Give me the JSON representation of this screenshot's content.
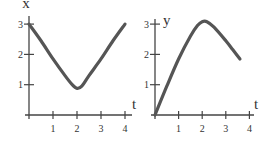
{
  "chart_data": [
    {
      "type": "line",
      "title": "",
      "xlabel": "t",
      "ylabel": "x",
      "xlim": [
        0,
        4
      ],
      "ylim": [
        0,
        3
      ],
      "xticks": [
        1,
        2,
        3,
        4
      ],
      "xtick_labels": [
        "1",
        "2",
        "3",
        "4"
      ],
      "yticks": [
        1,
        2,
        3
      ],
      "ytick_labels": [
        "1",
        "2",
        "3"
      ],
      "grid": false,
      "series": [
        {
          "name": "x(t)",
          "color": "#555555",
          "x": [
            0,
            0.5,
            1.0,
            1.5,
            1.8,
            2.0,
            2.2,
            2.5,
            3.0,
            3.5,
            4.0
          ],
          "y": [
            3.0,
            2.45,
            1.85,
            1.3,
            1.0,
            0.88,
            0.95,
            1.3,
            1.85,
            2.45,
            3.0
          ]
        }
      ]
    },
    {
      "type": "line",
      "title": "",
      "xlabel": "t",
      "ylabel": "y",
      "xlim": [
        0,
        4
      ],
      "ylim": [
        0,
        3
      ],
      "xticks": [
        1,
        2,
        3,
        4
      ],
      "xtick_labels": [
        "1",
        "2",
        "3",
        "4"
      ],
      "yticks": [
        1,
        2,
        3
      ],
      "ytick_labels": [
        "1",
        "2",
        "3"
      ],
      "grid": false,
      "series": [
        {
          "name": "y(t)",
          "color": "#555555",
          "x": [
            0,
            0.5,
            1.0,
            1.5,
            1.8,
            2.0,
            2.2,
            2.5,
            3.0,
            3.3,
            3.6
          ],
          "y": [
            0,
            0.95,
            1.85,
            2.6,
            2.95,
            3.08,
            3.08,
            2.9,
            2.45,
            2.15,
            1.85
          ]
        }
      ]
    }
  ]
}
